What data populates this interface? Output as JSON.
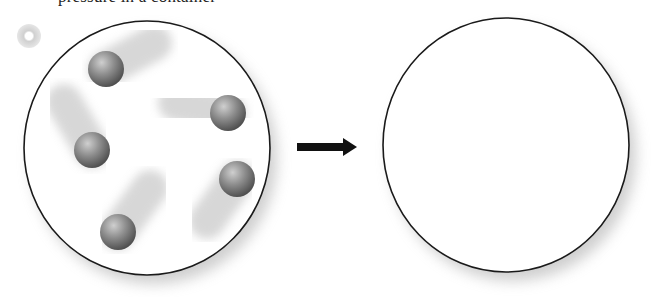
{
  "figure": {
    "caption_partial": "pressure in a container",
    "marker_icon": "disc-icon",
    "colors": {
      "outline": "#1a1a1a",
      "container_fill": "#ffffff",
      "shadow": "#9a9a9a",
      "ball_light": "#c8c8c8",
      "ball_mid": "#8a8a8a",
      "ball_dark": "#4a4a4a",
      "trail": "#bdbdbd",
      "arrow": "#111111"
    },
    "left_container": {
      "label": "container with moving particles",
      "cx": 147,
      "cy": 148,
      "rx": 123,
      "ry": 127,
      "particles": [
        {
          "cx": 106,
          "cy": 69,
          "r": 18,
          "trail_dx": 48,
          "trail_dy": -26
        },
        {
          "cx": 228,
          "cy": 113,
          "r": 18,
          "trail_dx": -52,
          "trail_dy": -10
        },
        {
          "cx": 92,
          "cy": 150,
          "r": 18,
          "trail_dx": -28,
          "trail_dy": -48
        },
        {
          "cx": 237,
          "cy": 179,
          "r": 18,
          "trail_dx": -30,
          "trail_dy": 42
        },
        {
          "cx": 118,
          "cy": 232,
          "r": 18,
          "trail_dx": 32,
          "trail_dy": -44
        }
      ]
    },
    "arrow": {
      "label": "transforms to",
      "x1": 297,
      "x2": 357,
      "y": 147
    },
    "right_container": {
      "label": "empty container",
      "cx": 506,
      "cy": 145,
      "rx": 123,
      "ry": 127
    }
  }
}
